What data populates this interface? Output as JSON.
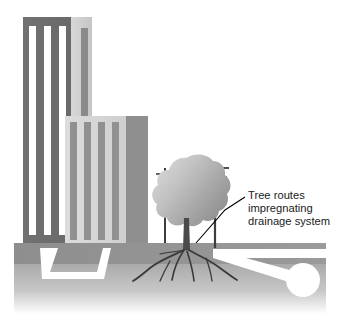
{
  "figure": {
    "background_color": "#ffffff",
    "width": 340,
    "height": 329
  },
  "annotation": {
    "lines": [
      "Tree routes",
      "impregnating",
      "drainage system"
    ],
    "text_color": "#1b1b1b",
    "leader_line_color": "#000000"
  },
  "scene": {
    "ground": {
      "upper_band_label": "upper soil band",
      "upper_band_color": "#8c8c8c",
      "lower_band_label": "lower soil band",
      "lower_band_color_top": "#a6a6a6",
      "lower_band_color_bottom": "#ffffff"
    },
    "buildings": [
      {
        "name": "tall-tower",
        "facade_color": "#6e6e6e",
        "accent_color": "#c9c9c9",
        "window_color": "#ffffff",
        "stripe_count": 3
      },
      {
        "name": "mid-rise",
        "facade_color": "#d4d4d4",
        "accent_color": "#8c8c8c",
        "stripe_color": "#8c8c8c",
        "stripe_count": 4
      }
    ],
    "tree": {
      "name": "street-tree",
      "canopy_color_light": "#d2d2d2",
      "canopy_color_dark": "#8f8f8f",
      "trunk_color": "#4a4a4a",
      "root_color": "#3d3d3d",
      "root_count": 6
    },
    "utility_poles": [
      {
        "name": "utility-pole-left",
        "crossarms": 1,
        "color": "#3d3d3d"
      },
      {
        "name": "utility-pole-right",
        "crossarms": 2,
        "color": "#3d3d3d"
      }
    ],
    "drainage": {
      "pipe_color": "#ffffff",
      "left_pipe_label": "building drainage pipe",
      "right_pipe_label": "main drain with inspection chamber",
      "chamber_shape": "circle"
    }
  }
}
